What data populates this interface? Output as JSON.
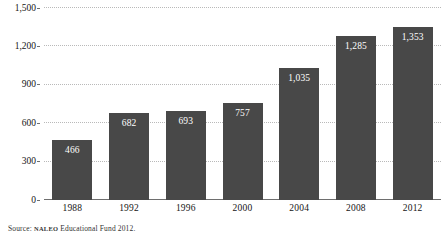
{
  "chart_data": {
    "type": "bar",
    "title": "",
    "subtitle": "",
    "xlabel": "",
    "ylabel": "",
    "categories": [
      "1988",
      "1992",
      "1996",
      "2000",
      "2004",
      "2008",
      "2012"
    ],
    "values": [
      466,
      682,
      693,
      757,
      1035,
      1285,
      1353
    ],
    "value_labels": [
      "466",
      "682",
      "693",
      "757",
      "1,035",
      "1,285",
      "1,353"
    ],
    "ylim": [
      0,
      1500
    ],
    "yticks": [
      0,
      300,
      600,
      900,
      1200,
      1500
    ],
    "ytick_labels": [
      "0",
      "300",
      "600",
      "900",
      "1,200",
      "1,500"
    ],
    "grid": true,
    "grid_style": "dotted-horizontal",
    "legend": false,
    "legend_position": "none",
    "bar_color": "#484848",
    "value_label_color": "#ffffff",
    "grid_color": "#b9b9b9",
    "axis_color": "#6e6e6e",
    "background_color": "#ffffff"
  },
  "source": {
    "prefix": "Source:",
    "organization": "NALEO",
    "rest": "Educational Fund 2012."
  }
}
